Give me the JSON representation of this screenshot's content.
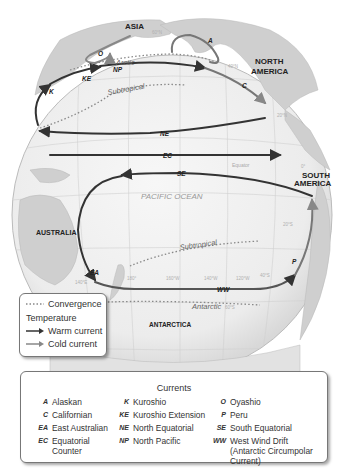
{
  "map": {
    "continents": [
      "ASIA",
      "NORTH AMERICA",
      "SOUTH AMERICA",
      "AUSTRALIA",
      "ANTARCTICA"
    ],
    "ocean_label": "PACIFIC OCEAN",
    "equator_label": "Equator",
    "latitude_labels": [
      "60°N",
      "40°N",
      "20°N",
      "0°",
      "20°S",
      "40°S",
      "60°S"
    ],
    "longitude_labels": [
      "140°E",
      "180°",
      "160°W",
      "140°W",
      "120°W"
    ],
    "convergence_labels": [
      "Arctic",
      "Subtropical",
      "Subtropical",
      "Antarctic"
    ],
    "current_codes_on_map": [
      "A",
      "O",
      "KE",
      "NP",
      "K",
      "C",
      "NE",
      "EC",
      "SE",
      "EA",
      "WW",
      "P"
    ]
  },
  "legend": {
    "convergence": "Convergence",
    "temperature_heading": "Temperature",
    "warm": "Warm current",
    "cold": "Cold current",
    "colors": {
      "warm": "#333333",
      "cold": "#8a8a8a",
      "convergence": "#888888"
    }
  },
  "currents": {
    "title": "Currents",
    "items": [
      {
        "code": "A",
        "name": "Alaskan"
      },
      {
        "code": "C",
        "name": "Californian"
      },
      {
        "code": "EA",
        "name": "East Australian"
      },
      {
        "code": "EC",
        "name": "Equatorial Counter"
      },
      {
        "code": "K",
        "name": "Kuroshio"
      },
      {
        "code": "KE",
        "name": "Kuroshio Extension"
      },
      {
        "code": "NE",
        "name": "North Equatorial"
      },
      {
        "code": "NP",
        "name": "North Pacific"
      },
      {
        "code": "O",
        "name": "Oyashio"
      },
      {
        "code": "P",
        "name": "Peru"
      },
      {
        "code": "SE",
        "name": "South Equatorial"
      },
      {
        "code": "WW",
        "name": "West Wind Drift (Antarctic Circumpolar Current)"
      }
    ]
  }
}
